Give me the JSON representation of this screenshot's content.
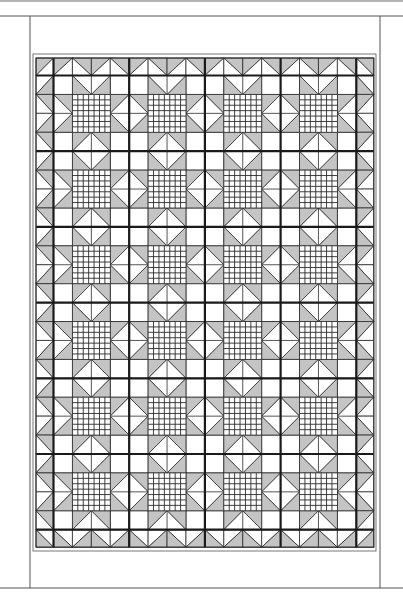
{
  "page": {
    "background": "#ffffff"
  },
  "colors": {
    "fill_dark": "#c4c4c4",
    "fill_light": "#ffffff",
    "line": "#2a2a2a",
    "thick_line": "#1a1a1a",
    "frame_line": "#555555",
    "top_rule": "#9a9a9a"
  },
  "frame": {
    "top_rule_y": 1,
    "header_rule_y": 16,
    "left_x": 30,
    "right_x": 380,
    "bottom_y": 588,
    "inner_left_x": 33,
    "inner_right_x": 376,
    "inner_top_y": 54,
    "inner_bottom_y": 551
  },
  "quilt": {
    "x": 36,
    "y": 58,
    "border_cell": 17.5,
    "block_size": 75.7,
    "columns": 4,
    "rows": 6,
    "cells_per_block": 4,
    "center_grid_divisions": 7,
    "pattern_name": "Sawtooth Star with checkerboard centers and sawtooth border"
  }
}
